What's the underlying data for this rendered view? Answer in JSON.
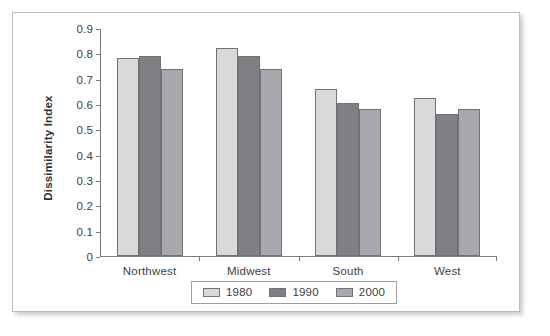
{
  "chart_data": {
    "type": "bar",
    "title": "",
    "subtitle": "",
    "xlabel": "",
    "ylabel": "Dissimilarity Index",
    "categories": [
      "Northwest",
      "Midwest",
      "South",
      "West"
    ],
    "series": [
      {
        "name": "1980",
        "color": "#d9d9d9",
        "values": [
          0.78,
          0.82,
          0.66,
          0.625
        ]
      },
      {
        "name": "1990",
        "color": "#7e8084",
        "values": [
          0.79,
          0.79,
          0.605,
          0.56
        ]
      },
      {
        "name": "2000",
        "color": "#a7a9ac",
        "values": [
          0.74,
          0.74,
          0.58,
          0.58
        ]
      }
    ],
    "ylim": [
      0,
      0.9
    ],
    "ytick_values": [
      0,
      0.1,
      0.2,
      0.3,
      0.4,
      0.5,
      0.6,
      0.7,
      0.8,
      0.9
    ],
    "ytick_labels": [
      "0",
      "0.1",
      "0.2",
      "0.3",
      "0.4",
      "0.5",
      "0.6",
      "0.7",
      "0.8",
      "0.9"
    ],
    "grid": false,
    "legend_position": "bottom",
    "legend_entries": [
      "1980",
      "1990",
      "2000"
    ],
    "annotations": []
  }
}
